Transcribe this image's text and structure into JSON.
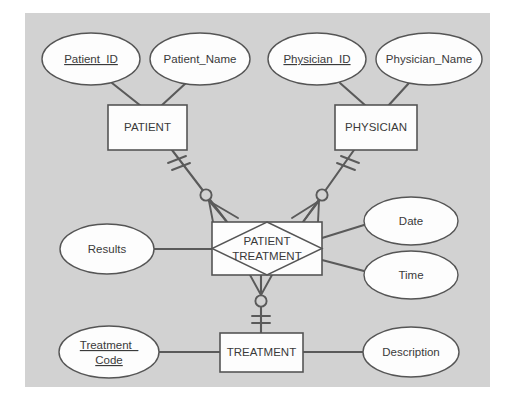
{
  "canvas": {
    "background_color": "#d2d2d2",
    "page_color": "#ffffff",
    "x": 25,
    "y": 13,
    "width": 465,
    "height": 374
  },
  "diagram": {
    "type": "entity-relationship-diagram",
    "notation": "crows-foot"
  },
  "entities": [
    {
      "id": "patient",
      "label": "PATIENT",
      "x": 108,
      "y": 105,
      "width": 79,
      "height": 45
    },
    {
      "id": "physician",
      "label": "PHYSICIAN",
      "x": 335,
      "y": 105,
      "width": 82,
      "height": 45
    },
    {
      "id": "treatment",
      "label": "TREATMENT",
      "x": 220,
      "y": 333,
      "width": 83,
      "height": 39
    }
  ],
  "associative_entity": {
    "id": "patient-treatment",
    "label_line1": "PATIENT",
    "label_line2": "TREATMENT",
    "x": 212,
    "y": 222,
    "width": 110,
    "height": 53
  },
  "attributes": [
    {
      "id": "patient-id",
      "label": "Patient_ID",
      "key": true,
      "cx": 91,
      "cy": 59,
      "rx": 49,
      "ry": 26
    },
    {
      "id": "patient-name",
      "label": "Patient_Name",
      "key": false,
      "cx": 200,
      "cy": 59,
      "rx": 50,
      "ry": 26
    },
    {
      "id": "physician-id",
      "label": "Physician_ID",
      "key": true,
      "cx": 317,
      "cy": 59,
      "rx": 49,
      "ry": 26
    },
    {
      "id": "physician-name",
      "label": "Physician_Name",
      "key": false,
      "cx": 429,
      "cy": 59,
      "rx": 53,
      "ry": 26
    },
    {
      "id": "results",
      "label": "Results",
      "key": false,
      "cx": 107,
      "cy": 249,
      "rx": 47,
      "ry": 25
    },
    {
      "id": "date",
      "label": "Date",
      "key": false,
      "cx": 411,
      "cy": 221,
      "rx": 47,
      "ry": 24
    },
    {
      "id": "time",
      "label": "Time",
      "key": false,
      "cx": 411,
      "cy": 275,
      "rx": 47,
      "ry": 24
    },
    {
      "id": "treatment-code",
      "label_line1": "Treatment_",
      "label_line2": "Code",
      "key": true,
      "cx": 109,
      "cy": 352,
      "rx": 50,
      "ry": 26
    },
    {
      "id": "description",
      "label": "Description",
      "key": false,
      "cx": 411,
      "cy": 352,
      "rx": 48,
      "ry": 25
    }
  ],
  "relationships": [
    {
      "id": "patient-to-patient-treatment",
      "from": "patient",
      "to": "patient-treatment",
      "from_cardinality": "exactly-one",
      "to_cardinality": "zero-or-many"
    },
    {
      "id": "physician-to-patient-treatment",
      "from": "physician",
      "to": "patient-treatment",
      "from_cardinality": "exactly-one",
      "to_cardinality": "zero-or-many"
    },
    {
      "id": "patient-treatment-to-treatment",
      "from": "patient-treatment",
      "to": "treatment",
      "from_cardinality": "zero-or-many",
      "to_cardinality": "exactly-one"
    }
  ],
  "attribute_links": [
    {
      "id": "link-patient-id",
      "from": "patient-id",
      "to": "patient"
    },
    {
      "id": "link-patient-name",
      "from": "patient-name",
      "to": "patient"
    },
    {
      "id": "link-physician-id",
      "from": "physician-id",
      "to": "physician"
    },
    {
      "id": "link-physician-name",
      "from": "physician-name",
      "to": "physician"
    },
    {
      "id": "link-results",
      "from": "results",
      "to": "patient-treatment"
    },
    {
      "id": "link-date",
      "from": "date",
      "to": "patient-treatment"
    },
    {
      "id": "link-time",
      "from": "time",
      "to": "patient-treatment"
    },
    {
      "id": "link-treatment-code",
      "from": "treatment-code",
      "to": "treatment"
    },
    {
      "id": "link-description",
      "from": "description",
      "to": "treatment"
    }
  ]
}
